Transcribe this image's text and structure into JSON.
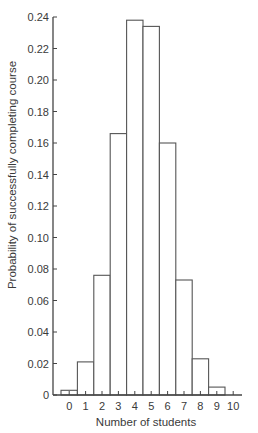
{
  "chart_data": {
    "type": "bar",
    "title": "",
    "xlabel": "Number of students",
    "ylabel": "Probability of successfully completing course",
    "categories": [
      "0",
      "1",
      "2",
      "3",
      "4",
      "5",
      "6",
      "7",
      "8",
      "9",
      "10"
    ],
    "values": [
      0.003,
      0.021,
      0.076,
      0.166,
      0.238,
      0.234,
      0.16,
      0.073,
      0.023,
      0.005,
      0.0003
    ],
    "ylim": [
      0,
      0.24
    ],
    "yticks": [
      0,
      0.02,
      0.04,
      0.06,
      0.08,
      0.1,
      0.12,
      0.14,
      0.16,
      0.18,
      0.2,
      0.22,
      0.24
    ],
    "ytick_labels": [
      "0",
      "0.02",
      "0.04",
      "0.06",
      "0.08",
      "0.10",
      "0.12",
      "0.14",
      "0.16",
      "0.18",
      "0.20",
      "0.22",
      "0.24"
    ],
    "grid": false,
    "legend": null,
    "bar_style": {
      "fill": "#ffffff",
      "stroke": "#555555"
    }
  },
  "colors": {
    "axis": "#444444",
    "bar_outline": "#555555",
    "text": "#3a3a3a",
    "background": "#ffffff"
  }
}
